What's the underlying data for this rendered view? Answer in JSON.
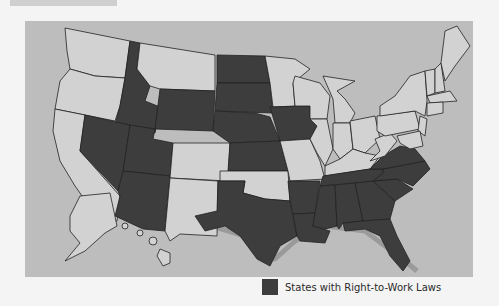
{
  "map": {
    "title": "",
    "legend": {
      "label": "States with Right-to-Work Laws",
      "swatch_color": "#3d3d3d"
    },
    "colors": {
      "right_to_work": "#3d3d3d",
      "other": "#d2d2d2",
      "water": "#bdbdbd",
      "border": "#222222"
    },
    "right_to_work_states": [
      "Idaho",
      "Nevada",
      "Utah",
      "Arizona",
      "Wyoming",
      "North Dakota",
      "South Dakota",
      "Nebraska",
      "Kansas",
      "Iowa",
      "Texas",
      "Oklahoma-excluded",
      "Arkansas",
      "Louisiana",
      "Mississippi",
      "Alabama",
      "Tennessee",
      "Georgia",
      "Florida",
      "South Carolina",
      "North Carolina",
      "Virginia"
    ],
    "other_states_shown": [
      "Washington",
      "Oregon",
      "California",
      "Montana",
      "Colorado",
      "New Mexico",
      "Oklahoma",
      "Minnesota",
      "Wisconsin",
      "Michigan",
      "Illinois",
      "Indiana",
      "Ohio",
      "Kentucky",
      "Missouri",
      "West Virginia",
      "Pennsylvania",
      "New York",
      "Maine",
      "Vermont",
      "New Hampshire",
      "Massachusetts",
      "Connecticut",
      "Rhode Island",
      "New Jersey",
      "Delaware",
      "Maryland",
      "Alaska",
      "Hawaii"
    ]
  }
}
